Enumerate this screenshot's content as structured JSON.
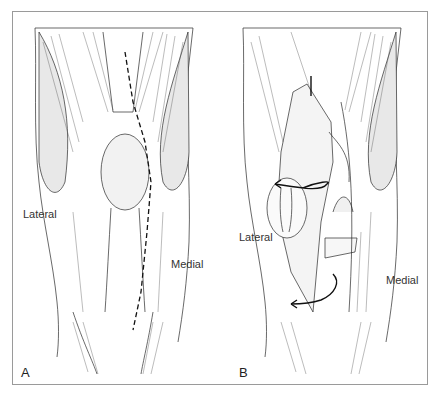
{
  "figure": {
    "panels": [
      {
        "letter": "A",
        "lateral_label": "Lateral",
        "medial_label": "Medial",
        "description": "Anterior knee with dashed incision line along the medial border of the patella"
      },
      {
        "letter": "B",
        "lateral_label": "Lateral",
        "medial_label": "Medial",
        "description": "Patella everted laterally with curved arrows indicating the eversion"
      }
    ],
    "colors": {
      "ink": "#2a2a2a",
      "border": "#9a9a9a",
      "background": "#ffffff"
    }
  }
}
